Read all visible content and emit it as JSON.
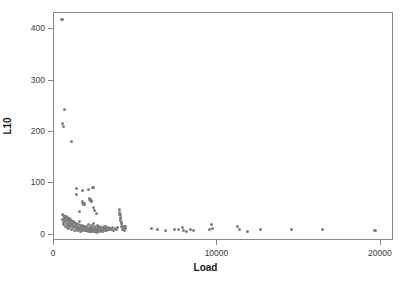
{
  "chart_data": {
    "type": "scatter",
    "title": "",
    "xlabel": "Load",
    "ylabel": "L10",
    "xlim": [
      0,
      20800
    ],
    "ylim": [
      -12,
      432
    ],
    "xticks": [
      0,
      10000,
      20000
    ],
    "xtick_labels": [
      "0",
      "10000",
      "20000"
    ],
    "yticks": [
      0,
      100,
      200,
      300,
      400
    ],
    "ytick_labels": [
      "0",
      "100",
      "200",
      "300",
      "400"
    ],
    "grid": false,
    "legend": false,
    "marker": {
      "shape": "circle",
      "color": "#7f7f7f",
      "size_px": 3.2
    },
    "frame_color": "#888888",
    "background": "#ffffff",
    "points": [
      [
        550,
        417
      ],
      [
        700,
        242
      ],
      [
        560,
        215
      ],
      [
        640,
        209
      ],
      [
        1150,
        180
      ],
      [
        1450,
        88
      ],
      [
        1800,
        85
      ],
      [
        2150,
        87
      ],
      [
        2450,
        91
      ],
      [
        1420,
        76
      ],
      [
        2250,
        68
      ],
      [
        2300,
        66
      ],
      [
        2380,
        64
      ],
      [
        1800,
        62
      ],
      [
        1900,
        58
      ],
      [
        2500,
        52
      ],
      [
        1600,
        44
      ],
      [
        2550,
        46
      ],
      [
        2650,
        40
      ],
      [
        4050,
        48
      ],
      [
        4080,
        42
      ],
      [
        4100,
        37
      ],
      [
        4120,
        31
      ],
      [
        4150,
        26
      ],
      [
        4180,
        21
      ],
      [
        600,
        38
      ],
      [
        640,
        36
      ],
      [
        680,
        34
      ],
      [
        700,
        33
      ],
      [
        730,
        31
      ],
      [
        760,
        30
      ],
      [
        790,
        28
      ],
      [
        820,
        34
      ],
      [
        860,
        26
      ],
      [
        900,
        31
      ],
      [
        940,
        24
      ],
      [
        980,
        29
      ],
      [
        1020,
        22
      ],
      [
        1060,
        27
      ],
      [
        1100,
        20
      ],
      [
        1140,
        25
      ],
      [
        1180,
        18
      ],
      [
        1220,
        23
      ],
      [
        1260,
        16
      ],
      [
        1300,
        22
      ],
      [
        1340,
        15
      ],
      [
        1380,
        20
      ],
      [
        1420,
        13
      ],
      [
        1460,
        19
      ],
      [
        1500,
        12
      ],
      [
        1540,
        18
      ],
      [
        1580,
        11
      ],
      [
        1620,
        24
      ],
      [
        1660,
        10
      ],
      [
        1700,
        17
      ],
      [
        1740,
        14
      ],
      [
        1780,
        9
      ],
      [
        1820,
        16
      ],
      [
        1860,
        12
      ],
      [
        1900,
        8
      ],
      [
        1940,
        15
      ],
      [
        1980,
        11
      ],
      [
        2020,
        7
      ],
      [
        2060,
        14
      ],
      [
        2100,
        10
      ],
      [
        2140,
        6
      ],
      [
        2180,
        18
      ],
      [
        2220,
        13
      ],
      [
        2260,
        9
      ],
      [
        2300,
        5
      ],
      [
        2340,
        16
      ],
      [
        2380,
        12
      ],
      [
        2420,
        8
      ],
      [
        2460,
        4
      ],
      [
        2500,
        20
      ],
      [
        2540,
        14
      ],
      [
        2580,
        10
      ],
      [
        2620,
        6
      ],
      [
        2660,
        3
      ],
      [
        2700,
        17
      ],
      [
        2740,
        12
      ],
      [
        2780,
        8
      ],
      [
        2820,
        5
      ],
      [
        2860,
        15
      ],
      [
        2900,
        11
      ],
      [
        2940,
        7
      ],
      [
        2980,
        13
      ],
      [
        3020,
        9
      ],
      [
        3060,
        6
      ],
      [
        3100,
        12
      ],
      [
        3140,
        8
      ],
      [
        3180,
        14
      ],
      [
        3220,
        10
      ],
      [
        3260,
        7
      ],
      [
        3300,
        11
      ],
      [
        3340,
        9
      ],
      [
        3400,
        13
      ],
      [
        3460,
        8
      ],
      [
        3520,
        11
      ],
      [
        3580,
        9
      ],
      [
        3650,
        12
      ],
      [
        3720,
        7
      ],
      [
        3800,
        10
      ],
      [
        3880,
        8
      ],
      [
        3960,
        13
      ],
      [
        4220,
        15
      ],
      [
        4260,
        9
      ],
      [
        4300,
        11
      ],
      [
        4350,
        7
      ],
      [
        4400,
        14
      ],
      [
        4450,
        10
      ],
      [
        560,
        28
      ],
      [
        620,
        22
      ],
      [
        660,
        18
      ],
      [
        710,
        25
      ],
      [
        760,
        15
      ],
      [
        810,
        20
      ],
      [
        870,
        13
      ],
      [
        920,
        17
      ],
      [
        970,
        11
      ],
      [
        1030,
        19
      ],
      [
        1090,
        14
      ],
      [
        1150,
        9
      ],
      [
        1210,
        16
      ],
      [
        1270,
        12
      ],
      [
        1330,
        7
      ],
      [
        1390,
        14
      ],
      [
        1450,
        10
      ],
      [
        1510,
        6
      ],
      [
        1570,
        13
      ],
      [
        1630,
        9
      ],
      [
        1690,
        5
      ],
      [
        1750,
        11
      ],
      [
        1810,
        7
      ],
      [
        1870,
        14
      ],
      [
        1930,
        10
      ],
      [
        1990,
        6
      ],
      [
        2050,
        12
      ],
      [
        2110,
        8
      ],
      [
        2170,
        5
      ],
      [
        2230,
        11
      ],
      [
        2290,
        7
      ],
      [
        2350,
        4
      ],
      [
        2410,
        10
      ],
      [
        2470,
        6
      ],
      [
        2530,
        9
      ],
      [
        2590,
        5
      ],
      [
        2650,
        8
      ],
      [
        2710,
        4
      ],
      [
        2770,
        7
      ],
      [
        2830,
        10
      ],
      [
        2890,
        6
      ],
      [
        2950,
        9
      ],
      [
        3010,
        5
      ],
      [
        3070,
        8
      ],
      [
        3130,
        11
      ],
      [
        3190,
        6
      ],
      [
        3250,
        9
      ],
      [
        6050,
        10
      ],
      [
        6400,
        8
      ],
      [
        6900,
        7
      ],
      [
        7450,
        9
      ],
      [
        7700,
        8
      ],
      [
        7900,
        12
      ],
      [
        8000,
        7
      ],
      [
        8150,
        4
      ],
      [
        8400,
        8
      ],
      [
        8600,
        7
      ],
      [
        9550,
        9
      ],
      [
        9700,
        18
      ],
      [
        9750,
        10
      ],
      [
        11300,
        14
      ],
      [
        11400,
        8
      ],
      [
        11900,
        4
      ],
      [
        12700,
        9
      ],
      [
        14600,
        8
      ],
      [
        16500,
        8
      ],
      [
        19700,
        6
      ]
    ]
  }
}
